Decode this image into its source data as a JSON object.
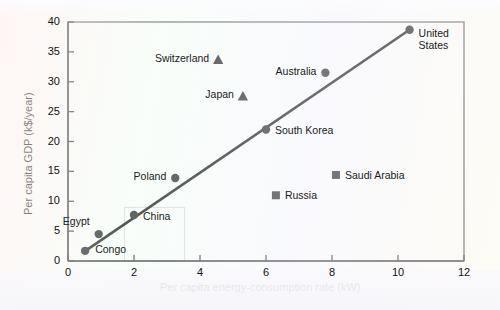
{
  "chart_data": {
    "type": "scatter",
    "title": "",
    "xlabel": "Per capita energy-consumption rate (kW)",
    "ylabel": "Per capita GDP (k$/year)",
    "xlim": [
      0,
      12
    ],
    "ylim": [
      0,
      40
    ],
    "xticks": [
      0,
      2,
      4,
      6,
      8,
      10,
      12
    ],
    "yticks": [
      0,
      5,
      10,
      15,
      20,
      25,
      30,
      35,
      40
    ],
    "xtick_labels": [
      "0",
      "2",
      "4",
      "6",
      "8",
      "10",
      "12"
    ],
    "ytick_labels": [
      "0",
      "5",
      "10",
      "15",
      "20",
      "25",
      "30",
      "35",
      "40"
    ],
    "grid": false,
    "legend": "none",
    "marker_color": "#111111",
    "line_color": "#000000",
    "points": [
      {
        "name": "Congo",
        "x": 0.52,
        "y": 1.7,
        "marker": "circle",
        "label_dx": 10,
        "label_dy": -1,
        "label_align": "left"
      },
      {
        "name": "Egypt",
        "x": 0.93,
        "y": 4.5,
        "marker": "circle",
        "label_dx": -9,
        "label_dy": -12,
        "label_align": "right"
      },
      {
        "name": "China",
        "x": 2.0,
        "y": 7.7,
        "marker": "circle",
        "label_dx": 9,
        "label_dy": 2,
        "label_align": "left"
      },
      {
        "name": "Poland",
        "x": 3.25,
        "y": 13.9,
        "marker": "circle",
        "label_dx": -9,
        "label_dy": -1,
        "label_align": "right"
      },
      {
        "name": "Switzerland",
        "x": 4.55,
        "y": 33.7,
        "marker": "triangle",
        "label_dx": -9,
        "label_dy": -1,
        "label_align": "right"
      },
      {
        "name": "Japan",
        "x": 5.3,
        "y": 27.6,
        "marker": "triangle",
        "label_dx": -9,
        "label_dy": -1,
        "label_align": "right"
      },
      {
        "name": "South Korea",
        "x": 6.0,
        "y": 22.0,
        "marker": "circle",
        "label_dx": 9,
        "label_dy": 1,
        "label_align": "left"
      },
      {
        "name": "Russia",
        "x": 6.3,
        "y": 11.0,
        "marker": "square",
        "label_dx": 9,
        "label_dy": 1,
        "label_align": "left"
      },
      {
        "name": "Australia",
        "x": 7.8,
        "y": 31.5,
        "marker": "circle",
        "label_dx": -9,
        "label_dy": -1,
        "label_align": "right"
      },
      {
        "name": "Saudi Arabia",
        "x": 8.12,
        "y": 14.4,
        "marker": "square",
        "label_dx": 9,
        "label_dy": 1,
        "label_align": "left"
      },
      {
        "name": "United States",
        "x": 10.35,
        "y": 38.7,
        "marker": "circle",
        "label_dx": 9,
        "label_dy": 4,
        "label_align": "left",
        "label_lines": [
          "United",
          "States"
        ]
      }
    ],
    "trend_line": {
      "name": "best-fit line",
      "x_start": 0.45,
      "y_start": 1.4,
      "x_end": 10.35,
      "y_end": 38.7
    }
  },
  "annotations": {
    "scan_artifact_rect": {
      "present": true
    }
  }
}
